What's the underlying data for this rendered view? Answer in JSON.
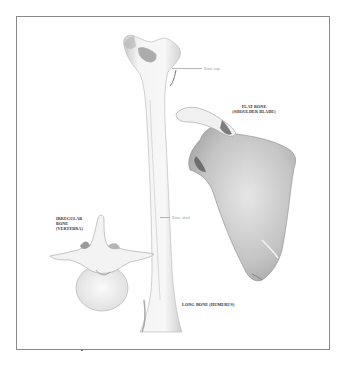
{
  "figure": {
    "type": "anatomical-illustration",
    "colors": {
      "frame_border": "#8a8a8a",
      "bone_light": "#f2f2f2",
      "bone_shade": "#bdbdbd",
      "bone_dark": "#8e8e8e",
      "label_text": "#2e2e2e"
    }
  },
  "labels": {
    "bone_cap": "Bone cap",
    "flat_bone_line1": "FLAT BONE",
    "flat_bone_line2": "(SHOULDER BLADE)",
    "irregular_line1": "IRREGULAR",
    "irregular_line2": "BONE",
    "irregular_line3": "(VERTEBRA)",
    "bone_shaft": "Bone shaft",
    "long_bone": "LONG BONE (HUMERUS)"
  }
}
